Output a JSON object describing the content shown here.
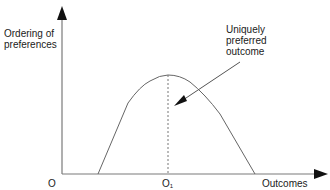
{
  "diagram": {
    "y_axis_label_line1": "Ordering of",
    "y_axis_label_line2": "preferences",
    "x_axis_label": "Outcomes",
    "origin_label": "O",
    "peak_label": "O",
    "peak_label_subscript": "1",
    "annotation_line1": "Uniquely",
    "annotation_line2": "preferred",
    "annotation_line3": "outcome",
    "colors": {
      "axis": "#7a7a7a",
      "curve": "#666666",
      "text": "#1a1a1a",
      "arrow": "#111111"
    }
  }
}
